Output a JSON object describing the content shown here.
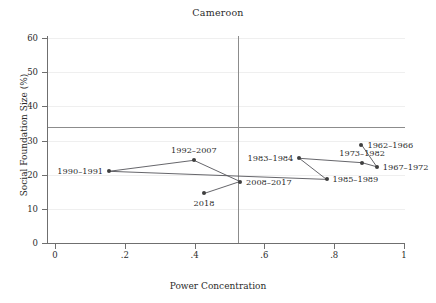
{
  "chart_data": {
    "type": "scatter",
    "title": "Cameroon",
    "xlabel": "Power Concentration",
    "ylabel": "Social Foundation Size (%)",
    "xlim": [
      0,
      1
    ],
    "ylim": [
      0,
      60
    ],
    "xticks": [
      0,
      0.2,
      0.4,
      0.6,
      0.8,
      1
    ],
    "xtick_labels": [
      "0",
      ".2",
      ".4",
      ".6",
      ".8",
      "1"
    ],
    "yticks": [
      0,
      10,
      20,
      30,
      40,
      50,
      60
    ],
    "ytick_labels": [
      "0",
      "10",
      "20",
      "30",
      "40",
      "50",
      "60"
    ],
    "grid": false,
    "legend": "none",
    "reference_lines": {
      "horizontal_y": 34,
      "vertical_x": 0.525
    },
    "points": [
      {
        "label": "1990–1991",
        "x": 0.155,
        "y": 21.0,
        "label_pos": "left"
      },
      {
        "label": "1992–2007",
        "x": 0.398,
        "y": 24.2,
        "label_pos": "above"
      },
      {
        "label": "2018",
        "x": 0.427,
        "y": 14.5,
        "label_pos": "below"
      },
      {
        "label": "2008–2017",
        "x": 0.53,
        "y": 18.0,
        "label_pos": "right"
      },
      {
        "label": "1983–1984",
        "x": 0.7,
        "y": 24.8,
        "label_pos": "left"
      },
      {
        "label": "1985–1989",
        "x": 0.778,
        "y": 18.6,
        "label_pos": "right"
      },
      {
        "label": "1973–1982",
        "x": 0.88,
        "y": 23.5,
        "label_pos": "above"
      },
      {
        "label": "1962–1966",
        "x": 0.878,
        "y": 28.8,
        "label_pos": "right"
      },
      {
        "label": "1967–1972",
        "x": 0.922,
        "y": 22.3,
        "label_pos": "right"
      }
    ],
    "path_order": [
      "1962–1966",
      "1967–1972",
      "1973–1982",
      "1983–1984",
      "1985–1989",
      "1990–1991",
      "1992–2007",
      "2008–2017",
      "2018"
    ]
  }
}
